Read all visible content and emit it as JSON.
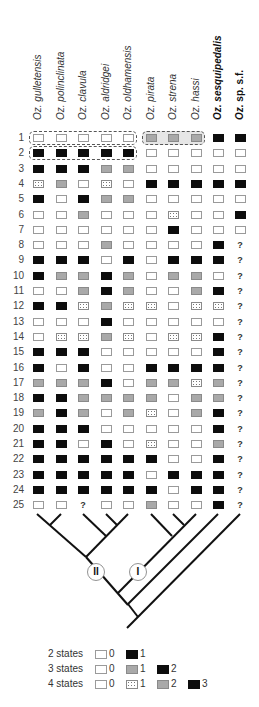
{
  "figure": {
    "taxa": [
      {
        "genus": "Oz.",
        "name": "gulletensis",
        "bold": false
      },
      {
        "genus": "Oz.",
        "name": "polinclinata",
        "bold": false
      },
      {
        "genus": "Oz.",
        "name": "clavula",
        "bold": false
      },
      {
        "genus": "Oz.",
        "name": "aldridgei",
        "bold": false
      },
      {
        "genus": "Oz.",
        "name": "oldhamensis",
        "bold": false
      },
      {
        "genus": "Oz.",
        "name": "pirata",
        "bold": false
      },
      {
        "genus": "Oz.",
        "name": "strena",
        "bold": false
      },
      {
        "genus": "Oz.",
        "name": "hassi",
        "bold": false
      },
      {
        "genus": "Oz.",
        "name": "sesquipedalis",
        "bold": true
      },
      {
        "genus": "Oz.",
        "name": "sp. s.f.",
        "bold": true
      }
    ],
    "state_key": {
      "W": "white",
      "B": "black",
      "G": "grey",
      "D": "dotted",
      "?": "unknown"
    },
    "matrix": [
      {
        "row": "1",
        "states": [
          "W",
          "W",
          "W",
          "W",
          "W",
          "G",
          "G",
          "G",
          "B",
          "B"
        ]
      },
      {
        "row": "2",
        "states": [
          "B",
          "B",
          "B",
          "B",
          "B",
          "W",
          "W",
          "W",
          "W",
          "W"
        ]
      },
      {
        "row": "3",
        "states": [
          "B",
          "B",
          "B",
          "G",
          "G",
          "W",
          "W",
          "W",
          "W",
          "W"
        ]
      },
      {
        "row": "4",
        "states": [
          "D",
          "G",
          "W",
          "D",
          "W",
          "B",
          "B",
          "B",
          "B",
          "B"
        ]
      },
      {
        "row": "5",
        "states": [
          "B",
          "W",
          "B",
          "G",
          "G",
          "W",
          "W",
          "W",
          "W",
          "W"
        ]
      },
      {
        "row": "6",
        "states": [
          "W",
          "W",
          "G",
          "W",
          "W",
          "W",
          "D",
          "W",
          "W",
          "B"
        ]
      },
      {
        "row": "7",
        "states": [
          "W",
          "W",
          "W",
          "W",
          "W",
          "W",
          "B",
          "W",
          "W",
          "W"
        ]
      },
      {
        "row": "8",
        "states": [
          "W",
          "W",
          "W",
          "G",
          "W",
          "W",
          "W",
          "W",
          "B",
          "?"
        ]
      },
      {
        "row": "9",
        "states": [
          "B",
          "B",
          "B",
          "W",
          "B",
          "W",
          "B",
          "B",
          "B",
          "?"
        ]
      },
      {
        "row": "10",
        "states": [
          "B",
          "G",
          "G",
          "B",
          "G",
          "W",
          "G",
          "G",
          "W",
          "?"
        ]
      },
      {
        "row": "11",
        "states": [
          "W",
          "W",
          "G",
          "B",
          "G",
          "W",
          "W",
          "G",
          "B",
          "?"
        ]
      },
      {
        "row": "12",
        "states": [
          "B",
          "B",
          "D",
          "G",
          "D",
          "D",
          "W",
          "D",
          "D",
          "?"
        ]
      },
      {
        "row": "13",
        "states": [
          "W",
          "W",
          "W",
          "B",
          "W",
          "W",
          "W",
          "W",
          "W",
          "?"
        ]
      },
      {
        "row": "14",
        "states": [
          "W",
          "D",
          "D",
          "G",
          "D",
          "W",
          "D",
          "D",
          "B",
          "?"
        ]
      },
      {
        "row": "15",
        "states": [
          "B",
          "B",
          "B",
          "W",
          "W",
          "W",
          "W",
          "W",
          "B",
          "?"
        ]
      },
      {
        "row": "16",
        "states": [
          "B",
          "W",
          "B",
          "W",
          "W",
          "B",
          "B",
          "B",
          "B",
          "?"
        ]
      },
      {
        "row": "17",
        "states": [
          "G",
          "G",
          "G",
          "B",
          "W",
          "G",
          "G",
          "D",
          "G",
          "?"
        ]
      },
      {
        "row": "18",
        "states": [
          "B",
          "B",
          "G",
          "G",
          "G",
          "G",
          "W",
          "G",
          "G",
          "?"
        ]
      },
      {
        "row": "19",
        "states": [
          "G",
          "B",
          "G",
          "W",
          "G",
          "D",
          "W",
          "G",
          "B",
          "?"
        ]
      },
      {
        "row": "20",
        "states": [
          "B",
          "B",
          "B",
          "W",
          "W",
          "W",
          "W",
          "W",
          "B",
          "?"
        ]
      },
      {
        "row": "21",
        "states": [
          "B",
          "B",
          "W",
          "B",
          "W",
          "D",
          "W",
          "W",
          "G",
          "?"
        ]
      },
      {
        "row": "22",
        "states": [
          "B",
          "B",
          "B",
          "B",
          "B",
          "B",
          "W",
          "W",
          "B",
          "?"
        ]
      },
      {
        "row": "23",
        "states": [
          "B",
          "B",
          "B",
          "B",
          "B",
          "W",
          "B",
          "B",
          "B",
          "?"
        ]
      },
      {
        "row": "24",
        "states": [
          "B",
          "B",
          "B",
          "B",
          "B",
          "B",
          "W",
          "B",
          "B",
          "?"
        ]
      },
      {
        "row": "25",
        "states": [
          "W",
          "W",
          "?",
          "W",
          "W",
          "G",
          "W",
          "W",
          "B",
          "?"
        ]
      }
    ],
    "groupings": [
      {
        "row": "1",
        "from_col": 0,
        "to_col": 4,
        "shaded": false
      },
      {
        "row": "1",
        "from_col": 5,
        "to_col": 7,
        "shaded": true
      },
      {
        "row": "2",
        "from_col": 0,
        "to_col": 4,
        "shaded": false
      }
    ],
    "tree": {
      "clade_labels": [
        {
          "label": "II",
          "description": "clade of gulletensis, polinclinata, clavula, aldridgei, oldhamensis"
        },
        {
          "label": "I",
          "description": "clade of pirata, strena, hassi"
        }
      ],
      "newick": "((((gulletensis,polinclinata),(clavula,(aldridgei,oldhamensis)))II,(pirata,(strena,hassi))I),sesquipedalis),sp_sf"
    },
    "legend": [
      {
        "label": "2 states",
        "items": [
          {
            "swatch": "W",
            "value": "0"
          },
          {
            "swatch": "B",
            "value": "1"
          }
        ]
      },
      {
        "label": "3 states",
        "items": [
          {
            "swatch": "W",
            "value": "0"
          },
          {
            "swatch": "G",
            "value": "1"
          },
          {
            "swatch": "B",
            "value": "2"
          }
        ]
      },
      {
        "label": "4 states",
        "items": [
          {
            "swatch": "W",
            "value": "0"
          },
          {
            "swatch": "D",
            "value": "1"
          },
          {
            "swatch": "G",
            "value": "2"
          },
          {
            "swatch": "B",
            "value": "3"
          }
        ]
      }
    ],
    "colors": {
      "black_state": "#0d0d0d",
      "grey_state": "#a9a9a9",
      "white_state": "#ffffff",
      "outline": "#9a9a9a",
      "tree_line": "#111111"
    }
  }
}
